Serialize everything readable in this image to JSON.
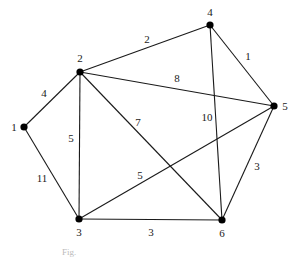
{
  "diagram": {
    "type": "weighted-undirected-graph",
    "nodes": [
      {
        "id": "1",
        "label": "1",
        "x": 24,
        "y": 127,
        "lx": 14,
        "ly": 131
      },
      {
        "id": "2",
        "label": "2",
        "x": 80,
        "y": 72,
        "lx": 80,
        "ly": 62
      },
      {
        "id": "3",
        "label": "3",
        "x": 79,
        "y": 219,
        "lx": 79,
        "ly": 236
      },
      {
        "id": "4",
        "label": "4",
        "x": 210,
        "y": 25,
        "lx": 210,
        "ly": 16
      },
      {
        "id": "5",
        "label": "5",
        "x": 274,
        "y": 106,
        "lx": 285,
        "ly": 110
      },
      {
        "id": "6",
        "label": "6",
        "x": 222,
        "y": 220,
        "lx": 222,
        "ly": 237
      }
    ],
    "edges": [
      {
        "from": "1",
        "to": "2",
        "weight": "4",
        "lx": 44,
        "ly": 97
      },
      {
        "from": "2",
        "to": "4",
        "weight": "2",
        "lx": 147,
        "ly": 43
      },
      {
        "from": "2",
        "to": "5",
        "weight": "8",
        "lx": 177,
        "ly": 82
      },
      {
        "from": "4",
        "to": "5",
        "weight": "1",
        "lx": 248,
        "ly": 60
      },
      {
        "from": "2",
        "to": "3",
        "weight": "5",
        "lx": 71,
        "ly": 142
      },
      {
        "from": "2",
        "to": "6",
        "weight": "7",
        "lx": 138,
        "ly": 126
      },
      {
        "from": "4",
        "to": "6",
        "weight": "10",
        "lx": 207,
        "ly": 121
      },
      {
        "from": "1",
        "to": "3",
        "weight": "11",
        "lx": 42,
        "ly": 182
      },
      {
        "from": "3",
        "to": "5",
        "weight": "5",
        "lx": 140,
        "ly": 179
      },
      {
        "from": "5",
        "to": "6",
        "weight": "3",
        "lx": 257,
        "ly": 170
      },
      {
        "from": "3",
        "to": "6",
        "weight": "3",
        "lx": 151,
        "ly": 236
      }
    ],
    "caption": "Fig."
  }
}
